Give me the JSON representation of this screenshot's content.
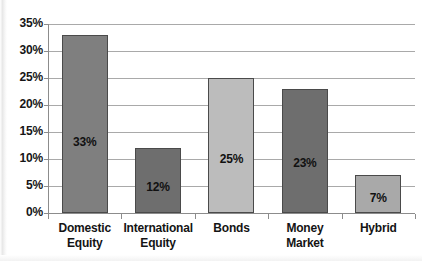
{
  "chart_data": {
    "type": "bar",
    "title": "",
    "xlabel": "",
    "ylabel": "",
    "categories": [
      "Domestic Equity",
      "International Equity",
      "Bonds",
      "Money Market",
      "Hybrid"
    ],
    "category_lines": [
      [
        "Domestic",
        "Equity"
      ],
      [
        "International",
        "Equity"
      ],
      [
        "Bonds"
      ],
      [
        "Money Market"
      ],
      [
        "Hybrid"
      ]
    ],
    "values": [
      33,
      12,
      25,
      23,
      7
    ],
    "data_labels": [
      "33%",
      "12%",
      "25%",
      "23%",
      "7%"
    ],
    "bar_colors": [
      "#7f7f7f",
      "#6e6e6e",
      "#bcbcbc",
      "#6e6e6e",
      "#a9a9a9"
    ],
    "bar_border_color": "#4a4a4a",
    "ylim": [
      0,
      35
    ],
    "ytick_values": [
      0,
      5,
      10,
      15,
      20,
      25,
      30,
      35
    ],
    "ytick_labels": [
      "0%",
      "5%",
      "10%",
      "15%",
      "20%",
      "25%",
      "30%",
      "35%"
    ],
    "grid": true,
    "grid_color": "#a9a9a9",
    "legend": false,
    "background": "#ffffff",
    "value_unit": "%"
  }
}
